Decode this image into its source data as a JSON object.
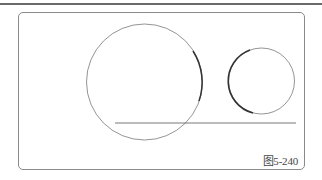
{
  "figure": {
    "caption": "图5-240",
    "colors": {
      "stroke": "#555555",
      "frame": "#8a8a8a",
      "rule": "#6a6a6a"
    },
    "shapes": {
      "large_circle": {
        "cx": 144.5,
        "cy": 82,
        "r": 58
      },
      "small_circle": {
        "cx": 261.5,
        "cy": 81,
        "r": 33
      },
      "line": {
        "x1": 115,
        "y1": 123,
        "x2": 296,
        "y2": 123
      }
    }
  }
}
